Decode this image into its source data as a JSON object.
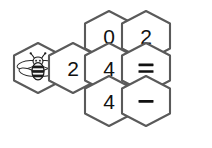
{
  "puzzle": {
    "title": "Honeycomb number puzzle",
    "background_color": "#ffffff",
    "hex_fill": "#ffffff",
    "hex_stroke": "#5a5a5a",
    "text_color": "#111111",
    "geometry": {
      "hex_width": 48,
      "hex_height": 50,
      "col_step": 36.5,
      "row_step": 36.5
    },
    "cells": [
      {
        "id": "bee",
        "kind": "icon",
        "icon": "bee-icon",
        "label": "",
        "cx": 38,
        "cy": 68
      },
      {
        "id": "top-left",
        "kind": "number",
        "icon": "",
        "label": "0",
        "cx": 109,
        "cy": 36
      },
      {
        "id": "top-right",
        "kind": "number",
        "icon": "",
        "label": "2",
        "cx": 146,
        "cy": 36
      },
      {
        "id": "mid-left",
        "kind": "number",
        "icon": "",
        "label": "2",
        "cx": 73,
        "cy": 68
      },
      {
        "id": "mid-center",
        "kind": "number",
        "icon": "",
        "label": "4",
        "cx": 109,
        "cy": 68
      },
      {
        "id": "mid-right",
        "kind": "operator",
        "icon": "equals-icon",
        "label": "=",
        "cx": 146,
        "cy": 68
      },
      {
        "id": "bottom-left",
        "kind": "number",
        "icon": "",
        "label": "4",
        "cx": 109,
        "cy": 101
      },
      {
        "id": "bottom-right",
        "kind": "operator",
        "icon": "minus-icon",
        "label": "−",
        "cx": 146,
        "cy": 101
      }
    ],
    "bee": {
      "icon_name": "bee-icon",
      "description": "cartoon bee with striped abdomen, antennae and four wings",
      "body_color": "#f2f2f2",
      "stripe_color": "#1a1a1a",
      "wing_color": "#ffffff"
    }
  }
}
